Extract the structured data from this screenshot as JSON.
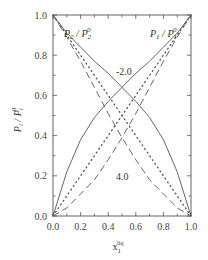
{
  "chart_data": {
    "type": "line",
    "title": "",
    "xlabel": "x1^liq",
    "ylabel": "Pi / Pi^0",
    "xlim": [
      0.0,
      1.0
    ],
    "ylim": [
      0.0,
      1.0
    ],
    "xticks": [
      "0.0",
      "0.2",
      "0.4",
      "0.6",
      "0.8",
      "1.0"
    ],
    "yticks": [
      "0.0",
      "0.2",
      "0.4",
      "0.6",
      "0.8",
      "1.0"
    ],
    "grid": false,
    "annotations": {
      "left_curve_label": "P2 / P2^0",
      "right_curve_label": "P1 / P1^0",
      "solid_label": "-2.0",
      "dashed_label": "4.0"
    },
    "x": [
      0.0,
      0.1,
      0.2,
      0.3,
      0.4,
      0.5,
      0.6,
      0.7,
      0.8,
      0.9,
      1.0
    ],
    "series": [
      {
        "name": "P1/P1^0 solid (-2.0)",
        "style": "solid",
        "values": [
          0.0,
          0.22,
          0.38,
          0.49,
          0.57,
          0.64,
          0.71,
          0.77,
          0.84,
          0.91,
          1.0
        ]
      },
      {
        "name": "P2/P2^0 solid (-2.0)",
        "style": "solid",
        "values": [
          1.0,
          0.91,
          0.84,
          0.77,
          0.71,
          0.64,
          0.57,
          0.49,
          0.38,
          0.22,
          0.0
        ]
      },
      {
        "name": "P1/P1^0 ideal",
        "style": "dotted",
        "values": [
          0.0,
          0.1,
          0.2,
          0.3,
          0.4,
          0.5,
          0.6,
          0.7,
          0.8,
          0.9,
          1.0
        ]
      },
      {
        "name": "P2/P2^0 ideal",
        "style": "dotted",
        "values": [
          1.0,
          0.9,
          0.8,
          0.7,
          0.6,
          0.5,
          0.4,
          0.3,
          0.2,
          0.1,
          0.0
        ]
      },
      {
        "name": "P1/P1^0 dashed (4.0)",
        "style": "dashed",
        "values": [
          0.0,
          0.04,
          0.11,
          0.18,
          0.28,
          0.39,
          0.51,
          0.64,
          0.77,
          0.89,
          1.0
        ]
      },
      {
        "name": "P2/P2^0 dashed (4.0)",
        "style": "dashed",
        "values": [
          1.0,
          0.89,
          0.77,
          0.64,
          0.51,
          0.39,
          0.28,
          0.18,
          0.11,
          0.04,
          0.0
        ]
      }
    ]
  }
}
